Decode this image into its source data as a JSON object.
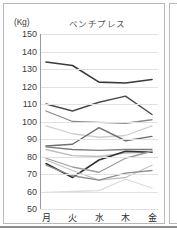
{
  "chart_data": {
    "type": "line",
    "title": "ベンチプレス",
    "unit_label": "(Kg)",
    "xlabel": "",
    "ylabel": "(Kg)",
    "categories": [
      "月",
      "火",
      "水",
      "木",
      "金"
    ],
    "yticks": [
      150,
      140,
      130,
      120,
      110,
      100,
      90,
      80,
      70,
      60,
      50
    ],
    "ylim": [
      50,
      150
    ],
    "grid": true,
    "legend": "none",
    "series": [
      {
        "name": "series-1",
        "color": "#3a3a3a",
        "width": 1.6,
        "values": [
          134,
          132,
          122.5,
          122,
          124
        ]
      },
      {
        "name": "series-2",
        "color": "#4a4a4a",
        "width": 1.4,
        "values": [
          110,
          106,
          111,
          114.5,
          104
        ]
      },
      {
        "name": "series-3",
        "color": "#8a8a8a",
        "width": 1.3,
        "values": [
          106,
          100,
          99.5,
          99,
          101
        ]
      },
      {
        "name": "series-4",
        "color": "#cfcfcf",
        "width": 1.3,
        "values": [
          97.5,
          93,
          91,
          92,
          97.5
        ]
      },
      {
        "name": "series-5",
        "color": "#6e6e6e",
        "width": 1.4,
        "values": [
          86,
          87,
          96.5,
          89,
          91.5
        ]
      },
      {
        "name": "series-6",
        "color": "#7d7d7d",
        "width": 1.3,
        "values": [
          85.5,
          84,
          83.5,
          84,
          84
        ]
      },
      {
        "name": "series-7",
        "color": "#bdbdbd",
        "width": 1.3,
        "values": [
          84,
          80.5,
          80,
          82,
          82.5
        ]
      },
      {
        "name": "series-8",
        "color": "#333333",
        "width": 1.5,
        "values": [
          76,
          68,
          78,
          83,
          82.5
        ]
      },
      {
        "name": "series-9",
        "color": "#9d9d9d",
        "width": 1.3,
        "values": [
          79,
          74,
          71,
          79,
          83
        ]
      },
      {
        "name": "series-10",
        "color": "#c4c4c4",
        "width": 1.3,
        "values": [
          78,
          72,
          66.5,
          68,
          75
        ]
      },
      {
        "name": "series-11",
        "color": "#8f8f8f",
        "width": 1.3,
        "values": [
          75,
          69,
          66.5,
          70.5,
          72
        ]
      },
      {
        "name": "series-12",
        "color": "#dcdcdc",
        "width": 1.3,
        "values": [
          59.5,
          60,
          60.5,
          67,
          62
        ]
      }
    ]
  }
}
